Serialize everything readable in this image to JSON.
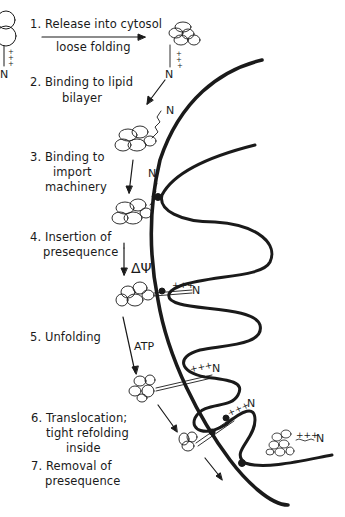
{
  "figure": {
    "steps": [
      {
        "num": "1.",
        "line1": "Release into cytosol",
        "line2": "loose folding"
      },
      {
        "num": "2.",
        "line1": "Binding to lipid",
        "line2": "bilayer"
      },
      {
        "num": "3.",
        "line1": "Binding to",
        "line2": "import",
        "line3": "machinery"
      },
      {
        "num": "4.",
        "line1": "Insertion of",
        "line2": "presequence"
      },
      {
        "num": "5.",
        "line1": "Unfolding"
      },
      {
        "num": "6.",
        "line1": "Translocation;",
        "line2": "tight refolding",
        "line3": "inside"
      },
      {
        "num": "7.",
        "line1": "Removal of",
        "line2": "presequence"
      }
    ],
    "annotations": {
      "delta_psi": "ΔΨ",
      "atp": "ATP",
      "n_terminus": "N",
      "charges": "+++"
    },
    "colors": {
      "ink": "#1a1a1a",
      "background": "#ffffff"
    }
  }
}
